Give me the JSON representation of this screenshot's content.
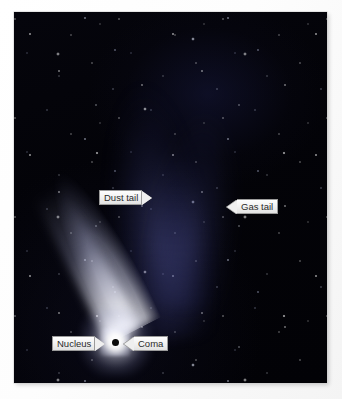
{
  "figure": {
    "background_color": "#ffffff",
    "sky_color": "#03030a",
    "dust_tail_color": "#ffffff",
    "gas_tail_color": "#5c60aa",
    "nucleus_color": "#0a0a0a",
    "label_text_color": "#2a2a2a",
    "label_fill_color": "#efefef",
    "label_border_color": "#9a9a9a"
  },
  "photo": {
    "frame": {
      "left": 14,
      "top": 12,
      "width": 313,
      "height": 371
    }
  },
  "labels": [
    {
      "id": "dust-tail",
      "text": "Dust tail",
      "direction": "right",
      "points_to": "dust-tail",
      "x": 85,
      "y": 178
    },
    {
      "id": "gas-tail",
      "text": "Gas tail",
      "direction": "left",
      "points_to": "gas-tail",
      "x": 213,
      "y": 187
    },
    {
      "id": "nucleus",
      "text": "Nucleus",
      "direction": "right",
      "points_to": "nucleus",
      "x": 38,
      "y": 324
    },
    {
      "id": "coma",
      "text": "Coma",
      "direction": "left",
      "points_to": "coma",
      "x": 110,
      "y": 324
    }
  ],
  "comet_parts": {
    "nucleus": "nucleus-dot",
    "coma": "coma-glow",
    "dust_tail": "dust-tail-beam",
    "gas_tail": "gas-tail-fan"
  }
}
